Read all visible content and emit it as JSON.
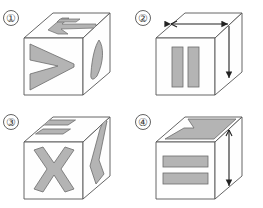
{
  "figure": {
    "panel_count": 4,
    "background_color": "#ffffff",
    "outline_color": "#555555",
    "marking_fill_color": "#b4b4b4",
    "marking_stroke_color": "#6b6b6b",
    "face_fill_color": "#fefefe",
    "arrow_color": "#222222"
  },
  "panels": [
    {
      "id": "panel-1",
      "label": "①",
      "label_plain": "1",
      "cube_name": "cube-one",
      "faces": {
        "top": {
          "marking": "plus-cross-shape",
          "marking_label": "cross"
        },
        "front": {
          "marking": "chevron-right-shape",
          "marking_label": "chevron"
        },
        "right": {
          "marking": "leaf-oval-shape",
          "marking_label": "leaf"
        }
      },
      "arrows": []
    },
    {
      "id": "panel-2",
      "label": "②",
      "label_plain": "2",
      "cube_name": "cube-two",
      "faces": {
        "top": {
          "marking": "none",
          "marking_label": ""
        },
        "front": {
          "marking": "two-vertical-bars",
          "marking_label": "two vertical bars"
        },
        "right": {
          "marking": "none",
          "marking_label": ""
        }
      },
      "arrows": [
        {
          "name": "top-double-arrow",
          "type": "double-headed",
          "direction": "horizontal",
          "face": "top"
        },
        {
          "name": "right-down-arrow",
          "type": "single-headed",
          "direction": "down",
          "face": "right"
        }
      ]
    },
    {
      "id": "panel-3",
      "label": "③",
      "label_plain": "3",
      "cube_name": "cube-three",
      "faces": {
        "top": {
          "marking": "two-parallel-bars",
          "marking_label": "two parallel bars"
        },
        "front": {
          "marking": "x-cross-shape",
          "marking_label": "X mark"
        },
        "right": {
          "marking": "bent-band-shape",
          "marking_label": "bent band"
        }
      },
      "arrows": []
    },
    {
      "id": "panel-4",
      "label": "④",
      "label_plain": "4",
      "cube_name": "cube-four",
      "faces": {
        "top": {
          "marking": "chevron-left-shape",
          "marking_label": "chevron"
        },
        "front": {
          "marking": "two-horizontal-bars",
          "marking_label": "two horizontal bars"
        },
        "right": {
          "marking": "none",
          "marking_label": ""
        }
      },
      "arrows": [
        {
          "name": "right-double-arrow",
          "type": "double-headed",
          "direction": "vertical",
          "face": "right"
        }
      ]
    }
  ]
}
